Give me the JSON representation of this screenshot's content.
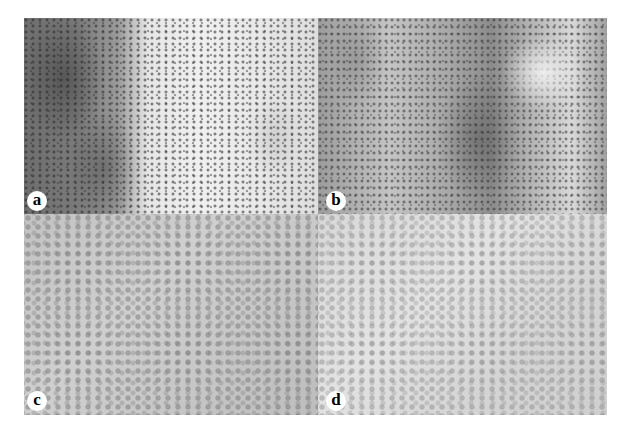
{
  "figure": {
    "type": "histology-micrograph-panel",
    "panels": [
      {
        "id": "a",
        "label": "a"
      },
      {
        "id": "b",
        "label": "b"
      },
      {
        "id": "c",
        "label": "c"
      },
      {
        "id": "d",
        "label": "d"
      }
    ]
  }
}
